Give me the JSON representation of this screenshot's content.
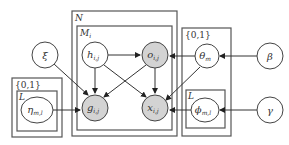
{
  "diagram": {
    "type": "plate-notation-graphical-model",
    "plates": {
      "N": {
        "label": "N"
      },
      "M": {
        "label": "M",
        "sub": "i"
      },
      "left_set": {
        "label": "{0,1}"
      },
      "left_L": {
        "label": "L"
      },
      "right_set": {
        "label": "{0,1}"
      },
      "right_L": {
        "label": "L"
      }
    },
    "nodes": {
      "xi": {
        "symbol": "ξ",
        "sub": "",
        "observed": false
      },
      "h": {
        "symbol": "h",
        "sub": "i,j",
        "observed": false
      },
      "o": {
        "symbol": "o",
        "sub": "i,j",
        "observed": true
      },
      "g": {
        "symbol": "g",
        "sub": "i,j",
        "observed": true
      },
      "x": {
        "symbol": "x",
        "sub": "i,j",
        "observed": true
      },
      "eta": {
        "symbol": "η",
        "sub": "m,l",
        "observed": false
      },
      "theta": {
        "symbol": "θ",
        "sub": "m",
        "observed": false
      },
      "phi": {
        "symbol": "ϕ",
        "sub": "m,l",
        "observed": false
      },
      "beta": {
        "symbol": "β",
        "sub": "",
        "observed": false
      },
      "gamma": {
        "symbol": "γ",
        "sub": "",
        "observed": false
      }
    },
    "edges": [
      {
        "from": "h",
        "to": "o"
      },
      {
        "from": "h",
        "to": "g"
      },
      {
        "from": "h",
        "to": "x"
      },
      {
        "from": "o",
        "to": "g"
      },
      {
        "from": "o",
        "to": "x"
      },
      {
        "from": "xi",
        "to": "g"
      },
      {
        "from": "eta",
        "to": "g"
      },
      {
        "from": "theta",
        "to": "o"
      },
      {
        "from": "theta",
        "to": "x"
      },
      {
        "from": "phi",
        "to": "x"
      },
      {
        "from": "beta",
        "to": "theta"
      },
      {
        "from": "gamma",
        "to": "phi"
      }
    ],
    "colors": {
      "observed_fill": "#d3d3d3",
      "latent_fill": "#ffffff",
      "stroke": "#444444"
    }
  }
}
